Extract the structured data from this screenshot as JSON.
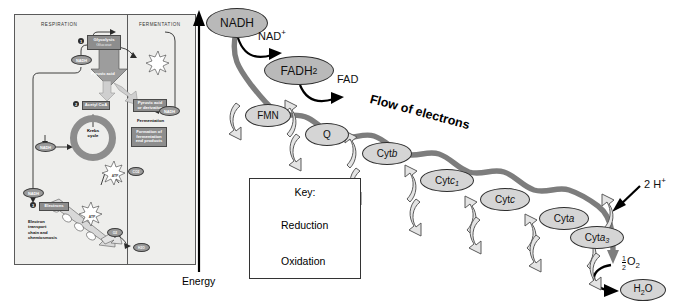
{
  "figure": {
    "flow_label": "Flow of electrons",
    "energy_axis_label": "Energy"
  },
  "colors": {
    "ribbon": "#7d7d7d",
    "carrier_fill": "#d5d5d5",
    "carrier_stroke": "#2e2e2e",
    "donor_fill": "#b9b9b9",
    "inset_bg": "#eeeeec",
    "inset_box": "#8d8d8d",
    "arrow_black": "#000000"
  },
  "donors": [
    {
      "name": "NADH",
      "product": "NAD",
      "product_sup": "+"
    },
    {
      "name": "FADH",
      "sub": "2",
      "product": "FAD",
      "product_sup": ""
    }
  ],
  "carriers": [
    {
      "label": "FMN",
      "italic": ""
    },
    {
      "label": "Q",
      "italic": ""
    },
    {
      "label": "Cyt ",
      "italic": "b"
    },
    {
      "label": "Cyt ",
      "italic": "c",
      "isub": "1"
    },
    {
      "label": "Cyt ",
      "italic": "c"
    },
    {
      "label": "Cyt ",
      "italic": "a"
    },
    {
      "label": "Cyt ",
      "italic": "a",
      "isub": "3"
    }
  ],
  "terminus": {
    "protons": "2 H",
    "protons_sup": "+",
    "oxygen_num": "1",
    "oxygen_den": "2",
    "oxygen": "O",
    "oxygen_sub": "2",
    "water": "H",
    "water_sub": "2",
    "water_tail": "O"
  },
  "key": {
    "title": "Key:",
    "reduction": "Reduction",
    "oxidation": "Oxidation"
  },
  "inset": {
    "headers": {
      "left": "RESPIRATION",
      "right": "FERMENTATION"
    },
    "steps": {
      "one": "1",
      "two": "2",
      "three": "3"
    },
    "glycolysis_title": "Glycolysis",
    "glycolysis_sub": "Glucose",
    "pyruvic_acid": "Pyruvic acid",
    "acetyl_coa": "Acetyl CoA",
    "krebs": "Krebs\ncycle",
    "pyruvic_derivative": "Pyruvic acid\nor derivative",
    "fermentation_label": "Fermentation",
    "fermentation_products": "Formation of\nfermentation\nend products",
    "electrons": "Electrons",
    "etc_label": "Electron\ntransport\nchain and\nchemiosmosis",
    "nadh": "NADH",
    "atp": "ATP",
    "co2": "CO2",
    "o2": "O2",
    "h2o": "H2O"
  }
}
